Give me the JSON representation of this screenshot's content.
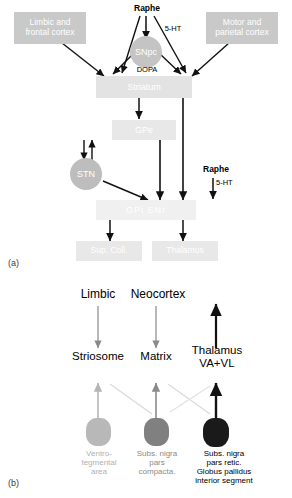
{
  "figure": {
    "panels": [
      {
        "tag": "(a)",
        "name": "panel-a"
      },
      {
        "tag": "(b)",
        "name": "panel-b"
      }
    ]
  },
  "panel_a": {
    "boxes": [
      {
        "id": "limbic-frontal-cortex",
        "label": "Limbic and\nfrontal cortex",
        "fill": "#c9c9c9",
        "text_color": "#ffffff"
      },
      {
        "id": "motor-parietal-cortex",
        "label": "Motor and\nparietal cortex",
        "fill": "#c9c9c9",
        "text_color": "#ffffff"
      },
      {
        "id": "striatum",
        "label": "Striatum",
        "fill": "#e3e3e3",
        "text_color": "#ffffff"
      },
      {
        "id": "gpe",
        "label": "GPe",
        "fill": "#e8e8e8",
        "text_color": "#ffffff"
      },
      {
        "id": "gpi-snr",
        "label": "GPi  SNr",
        "fill": "#f0f0f0",
        "text_color": "#ffffff"
      },
      {
        "id": "sup-coll",
        "label": "Sup. Coll.",
        "fill": "#e8e8e8",
        "text_color": "#ffffff"
      },
      {
        "id": "thalamus",
        "label": "Thalamus",
        "fill": "#e8e8e8",
        "text_color": "#ffffff"
      }
    ],
    "circles": [
      {
        "id": "snpc",
        "label": "SNpc",
        "fill": "#c4c4c4",
        "text_color": "#ffffff"
      },
      {
        "id": "stn",
        "label": "STN",
        "fill": "#bdbdbd",
        "text_color": "#ffffff"
      }
    ],
    "labels": [
      {
        "id": "raphe-top",
        "text": "Raphe",
        "bold": true,
        "color": "#000000"
      },
      {
        "id": "serotonin-top",
        "text": "5-HT",
        "bold": false,
        "color": "#000000"
      },
      {
        "id": "dopa",
        "text": "DOPA",
        "bold": false,
        "color": "#000000"
      },
      {
        "id": "raphe-lower",
        "text": "Raphe",
        "bold": true,
        "color": "#000000"
      },
      {
        "id": "serotonin-lower",
        "text": "5-HT",
        "bold": false,
        "color": "#000000"
      }
    ]
  },
  "panel_b": {
    "columns": [
      {
        "id": "limbic-column",
        "top_label": "Limbic",
        "mid_label": "Striosome",
        "blob_fill": "#b8b8b8",
        "bottom_label": "Ventro-\ntegmental\narea",
        "bottom_color": "#b0b0b0",
        "arrow_color": "#b5b5b5",
        "emphasis": "light"
      },
      {
        "id": "neocortex-matrix-column",
        "top_label": "Neocortex",
        "mid_label": "Matrix",
        "blob_fill": "#808080",
        "bottom_label": "Subs. nigra\npars\ncompacta.",
        "bottom_color": "#8a8a8a",
        "arrow_color": "#8a8a8a",
        "emphasis": "medium"
      },
      {
        "id": "thalamus-column",
        "top_label": "",
        "mid_label": "Thalamus\nVA+VL",
        "blob_fill": "#1a1a1a",
        "bottom_label": "Subs. nigra\npars retic.\nGlobus pallidus\ninterior segment",
        "bottom_color": "#000000",
        "arrow_color": "#000000",
        "emphasis": "dark"
      }
    ]
  },
  "colors": {
    "arrow_dark": "#111111",
    "arrow_light": "#b5b5b5",
    "arrow_medium": "#8a8a8a",
    "box_gray": "#c9c9c9",
    "box_pale": "#e8e8e8",
    "background": "#ffffff"
  }
}
